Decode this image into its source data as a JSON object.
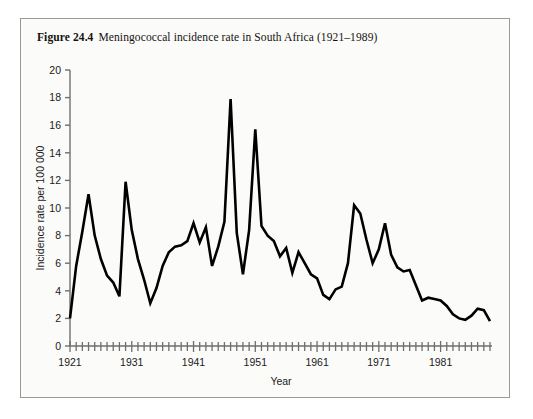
{
  "figure": {
    "number": "Figure 24.4",
    "caption": "Meningococcal incidence rate in South Africa (1921–1989)"
  },
  "chart_data": {
    "type": "line",
    "title": "Meningococcal incidence rate in South Africa (1921–1989)",
    "xlabel": "Year",
    "ylabel": "Incidence rate per 100 000",
    "xlim": [
      1921,
      1989
    ],
    "ylim": [
      0,
      20
    ],
    "yticks": [
      0,
      2,
      4,
      6,
      8,
      10,
      12,
      14,
      16,
      18,
      20
    ],
    "ytick_labels": [
      "0",
      "2",
      "4",
      "6",
      "8",
      "10",
      "12",
      "14",
      "16",
      "18",
      "20"
    ],
    "xtick_labels": [
      "1921",
      "1931",
      "1941",
      "1951",
      "1961",
      "1971",
      "1981"
    ],
    "xticks_major": [
      1921,
      1931,
      1941,
      1951,
      1961,
      1971,
      1981
    ],
    "x_minor_tick_step": 1,
    "grid": false,
    "legend": null,
    "line_color": "#000000",
    "line_width": 2.6,
    "x": [
      1921,
      1922,
      1923,
      1924,
      1925,
      1926,
      1927,
      1928,
      1929,
      1930,
      1931,
      1932,
      1933,
      1934,
      1935,
      1936,
      1937,
      1938,
      1939,
      1940,
      1941,
      1942,
      1943,
      1944,
      1945,
      1946,
      1947,
      1948,
      1949,
      1950,
      1951,
      1952,
      1953,
      1954,
      1955,
      1956,
      1957,
      1958,
      1959,
      1960,
      1961,
      1962,
      1963,
      1964,
      1965,
      1966,
      1967,
      1968,
      1969,
      1970,
      1971,
      1972,
      1973,
      1974,
      1975,
      1976,
      1977,
      1978,
      1979,
      1980,
      1981,
      1982,
      1983,
      1984,
      1985,
      1986,
      1987,
      1988,
      1989
    ],
    "values": [
      2.0,
      5.8,
      8.3,
      11.0,
      8.0,
      6.3,
      5.1,
      4.6,
      3.6,
      11.9,
      8.4,
      6.3,
      4.8,
      3.1,
      4.2,
      5.8,
      6.8,
      7.2,
      7.3,
      7.6,
      8.9,
      7.5,
      8.6,
      5.8,
      7.2,
      9.0,
      17.9,
      8.2,
      5.2,
      8.4,
      15.7,
      8.7,
      8.0,
      7.6,
      6.5,
      7.1,
      5.3,
      6.8,
      6.0,
      5.2,
      4.9,
      3.7,
      3.4,
      4.1,
      4.3,
      6.0,
      10.2,
      9.6,
      7.7,
      6.0,
      7.0,
      8.9,
      6.6,
      5.7,
      5.4,
      5.5,
      4.4,
      3.3,
      3.5,
      3.4,
      3.3,
      2.9,
      2.3,
      2.0,
      1.9,
      2.2,
      2.7,
      2.6,
      1.8
    ]
  }
}
